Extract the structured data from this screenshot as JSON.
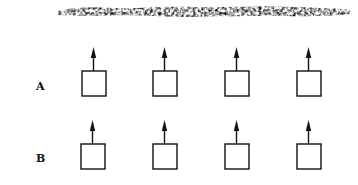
{
  "figure": {
    "top_band": {
      "description": "rough textured surface strip",
      "color": "#111111"
    },
    "rows": [
      {
        "label": "A",
        "units": [
          {
            "x": 81,
            "y": 47
          },
          {
            "x": 152,
            "y": 47
          },
          {
            "x": 224,
            "y": 47
          },
          {
            "x": 296,
            "y": 47
          }
        ]
      },
      {
        "label": "B",
        "units": [
          {
            "x": 80,
            "y": 120
          },
          {
            "x": 152,
            "y": 120
          },
          {
            "x": 224,
            "y": 120
          },
          {
            "x": 296,
            "y": 120
          }
        ]
      }
    ],
    "stroke_color": "#111111"
  }
}
